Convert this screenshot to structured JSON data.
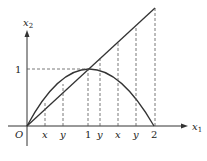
{
  "diagram": {
    "axes": {
      "x_label": "x",
      "x_sub": "1",
      "y_label": "x",
      "y_sub": "2",
      "origin_label": "O"
    },
    "x_ticks": [
      "x",
      "y",
      "1",
      "y",
      "x",
      "y",
      "2"
    ],
    "y_ticks": [
      "1"
    ],
    "curves": [
      {
        "name": "line",
        "description": "x2 = x1 from O to x1=2"
      },
      {
        "name": "parabola",
        "description": "arc from O through (1,1) to (2,0)"
      }
    ]
  }
}
